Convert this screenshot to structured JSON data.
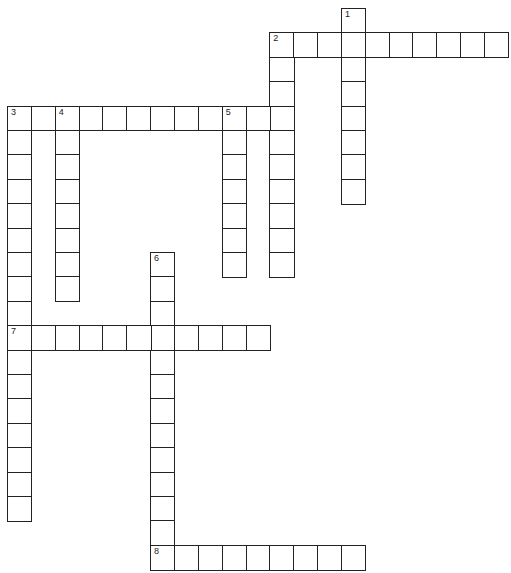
{
  "puzzle": {
    "type": "crossword",
    "grid": {
      "cols": 21,
      "rows": 23,
      "origin_x": 7,
      "origin_y": 8,
      "cell_w": 23.85,
      "cell_h": 24.4
    },
    "line_color": "#222222",
    "background": "#ffffff",
    "entries": [
      {
        "number": "1",
        "direction": "down",
        "row": 0,
        "col": 14,
        "length": 8
      },
      {
        "number": "2",
        "direction": "across",
        "row": 1,
        "col": 11,
        "length": 10
      },
      {
        "number": "2",
        "direction": "down",
        "row": 1,
        "col": 11,
        "length": 10
      },
      {
        "number": "3",
        "direction": "across",
        "row": 4,
        "col": 0,
        "length": 12
      },
      {
        "number": "3",
        "direction": "down",
        "row": 4,
        "col": 0,
        "length": 17
      },
      {
        "number": "4",
        "direction": "down",
        "row": 4,
        "col": 2,
        "length": 8
      },
      {
        "number": "5",
        "direction": "down",
        "row": 4,
        "col": 9,
        "length": 7
      },
      {
        "number": "6",
        "direction": "down",
        "row": 10,
        "col": 6,
        "length": 13
      },
      {
        "number": "7",
        "direction": "across",
        "row": 13,
        "col": 0,
        "length": 11
      },
      {
        "number": "8",
        "direction": "across",
        "row": 22,
        "col": 6,
        "length": 9
      }
    ]
  }
}
